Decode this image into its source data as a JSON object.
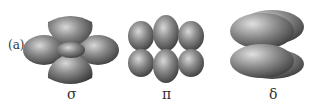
{
  "figure": {
    "panel_label": "(a)",
    "orbitals": [
      {
        "symbol": "σ",
        "name": "sigma"
      },
      {
        "symbol": "π",
        "name": "pi"
      },
      {
        "symbol": "δ",
        "name": "delta"
      }
    ]
  }
}
